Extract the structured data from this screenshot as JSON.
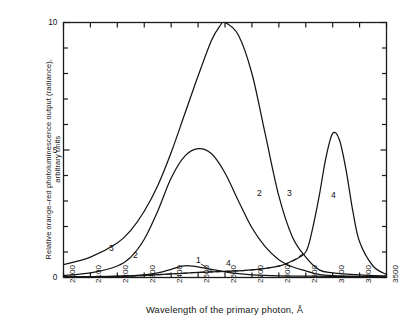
{
  "chart_data": {
    "type": "line",
    "title": "",
    "xlabel": "Wavelength of the primary photon, Å",
    "ylabel": "Relative orange–red photoluminescence output (radiance),\narbitrary units",
    "xtick_labels": [
      "2000",
      "2100",
      "2200",
      "2300",
      "2400",
      "2500",
      "2600",
      "2700",
      "2800",
      "2900",
      "3100",
      "3300",
      "3500"
    ],
    "xtick_values": [
      2000,
      2100,
      2200,
      2300,
      2400,
      2500,
      2600,
      2700,
      2800,
      2900,
      3100,
      3300,
      3500
    ],
    "ytick_labels": [
      "0",
      "5",
      "10"
    ],
    "ytick_values": [
      0,
      5,
      10
    ],
    "ylim": [
      0,
      10
    ],
    "grid": false,
    "legend": "inline-curve-numbers",
    "axis_note": "x-axis is piecewise/compressed above 2900 Å",
    "series": [
      {
        "name": "1",
        "label": "1",
        "style": "solid",
        "x": [
          2000,
          2100,
          2200,
          2300,
          2350,
          2400,
          2430,
          2450,
          2480,
          2500,
          2530,
          2560,
          2600,
          2650,
          2700,
          2800,
          2900,
          3100,
          3300,
          3500
        ],
        "y": [
          0.02,
          0.03,
          0.05,
          0.1,
          0.18,
          0.32,
          0.42,
          0.46,
          0.45,
          0.42,
          0.36,
          0.3,
          0.22,
          0.15,
          0.1,
          0.06,
          0.05,
          0.04,
          0.03,
          0.02
        ]
      },
      {
        "name": "2",
        "label": "2",
        "style": "solid",
        "x": [
          2000,
          2100,
          2200,
          2250,
          2300,
          2350,
          2400,
          2450,
          2500,
          2550,
          2600,
          2650,
          2700,
          2750,
          2800,
          2850,
          2900,
          3000,
          3100,
          3300,
          3500
        ],
        "y": [
          0.08,
          0.18,
          0.45,
          0.8,
          1.5,
          2.6,
          3.9,
          4.75,
          5.05,
          4.85,
          4.1,
          3.0,
          1.95,
          1.2,
          0.7,
          0.42,
          0.26,
          0.12,
          0.07,
          0.04,
          0.03
        ]
      },
      {
        "name": "3",
        "label": "3",
        "style": "solid",
        "x": [
          2000,
          2100,
          2200,
          2250,
          2300,
          2350,
          2400,
          2450,
          2500,
          2550,
          2580,
          2600,
          2650,
          2700,
          2750,
          2800,
          2850,
          2900,
          3000,
          3100,
          3300,
          3500
        ],
        "y": [
          0.5,
          0.8,
          1.35,
          1.85,
          2.6,
          3.6,
          4.9,
          6.4,
          7.9,
          9.3,
          9.85,
          10.0,
          9.5,
          8.0,
          5.6,
          3.2,
          1.6,
          0.8,
          0.3,
          0.18,
          0.1,
          0.06
        ]
      },
      {
        "name": "4",
        "label": "4",
        "style": "solid-with-dashed-tail",
        "x": [
          2000,
          2200,
          2400,
          2500,
          2600,
          2700,
          2800,
          2850,
          2900,
          2950,
          3000,
          3050,
          3100,
          3150,
          3200,
          3250,
          3300,
          3400,
          3500
        ],
        "y": [
          0.02,
          0.04,
          0.14,
          0.2,
          0.24,
          0.3,
          0.45,
          0.65,
          1.0,
          1.9,
          3.2,
          4.7,
          5.65,
          5.4,
          4.2,
          2.6,
          1.4,
          0.45,
          0.12
        ]
      }
    ],
    "curve_number_labels": [
      {
        "text": "3",
        "x_px": 109,
        "y_px": 243
      },
      {
        "text": "2",
        "x_px": 133,
        "y_px": 250
      },
      {
        "text": "1",
        "x_px": 196,
        "y_px": 255
      },
      {
        "text": "4",
        "x_px": 226,
        "y_px": 258
      },
      {
        "text": "2",
        "x_px": 257,
        "y_px": 188
      },
      {
        "text": "3",
        "x_px": 287,
        "y_px": 188
      },
      {
        "text": "4",
        "x_px": 331,
        "y_px": 190
      }
    ],
    "colors": {
      "axis": "#1a1a1a",
      "curve": "#151515",
      "background": "#ffffff"
    }
  }
}
